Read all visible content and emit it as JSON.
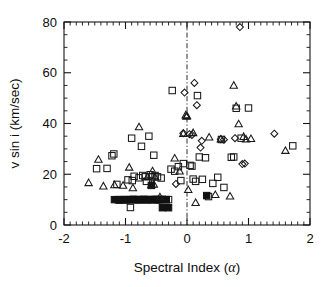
{
  "chart_data": {
    "type": "scatter",
    "title": "",
    "xlabel": "Spectral Index (α)",
    "ylabel": "v sin i (km/sec)",
    "xlim": [
      -2,
      2
    ],
    "ylim": [
      0,
      80
    ],
    "xticks": [
      -2,
      -1,
      0,
      1,
      2
    ],
    "xtick_labels": [
      "-2",
      "-1",
      "0",
      "1",
      "2"
    ],
    "yticks": [
      0,
      20,
      40,
      60,
      80
    ],
    "ytick_labels": [
      "0",
      "20",
      "40",
      "60",
      "80"
    ],
    "x_minor_tick_step": 0.1,
    "y_minor_tick_step": 5,
    "grid": false,
    "legend": null,
    "annotations": [
      {
        "type": "vline",
        "x": 0,
        "style": "dash-dot",
        "label": "alpha = 0 reference line"
      }
    ],
    "series": [
      {
        "name": "open-square",
        "marker": "square-open",
        "points": [
          [
            -1.47,
            22.2
          ],
          [
            -1.3,
            22.3
          ],
          [
            -1.22,
            27.3
          ],
          [
            -1.19,
            28.0
          ],
          [
            -1.14,
            16.0
          ],
          [
            -1.12,
            10.0
          ],
          [
            -1.07,
            10.0
          ],
          [
            -1.02,
            10.0
          ],
          [
            -0.98,
            9.9
          ],
          [
            -0.96,
            17.8
          ],
          [
            -0.95,
            10.0
          ],
          [
            -0.92,
            6.9
          ],
          [
            -0.9,
            34.2
          ],
          [
            -0.89,
            17.5
          ],
          [
            -0.88,
            10.1
          ],
          [
            -0.86,
            19.2
          ],
          [
            -0.84,
            10.0
          ],
          [
            -0.8,
            10.0
          ],
          [
            -0.78,
            18.6
          ],
          [
            -0.76,
            10.0
          ],
          [
            -0.74,
            31.0
          ],
          [
            -0.72,
            19.5
          ],
          [
            -0.7,
            10.1
          ],
          [
            -0.68,
            19.0
          ],
          [
            -0.66,
            17.2
          ],
          [
            -0.64,
            10.0
          ],
          [
            -0.62,
            35.0
          ],
          [
            -0.6,
            19.8
          ],
          [
            -0.58,
            10.0
          ],
          [
            -0.56,
            19.0
          ],
          [
            -0.54,
            27.5
          ],
          [
            -0.52,
            19.5
          ],
          [
            -0.5,
            10.0
          ],
          [
            -0.48,
            19.0
          ],
          [
            -0.46,
            10.0
          ],
          [
            -0.44,
            10.0
          ],
          [
            -0.42,
            18.5
          ],
          [
            -0.4,
            10.1
          ],
          [
            -0.34,
            10.0
          ],
          [
            -0.3,
            10.0
          ],
          [
            -0.26,
            22.0
          ],
          [
            -0.24,
            53.0
          ],
          [
            -0.2,
            21.2
          ],
          [
            -0.14,
            23.0
          ],
          [
            -0.1,
            17.5
          ],
          [
            -0.06,
            24.2
          ],
          [
            0.05,
            23.5
          ],
          [
            0.08,
            23.2
          ],
          [
            0.1,
            18.1
          ],
          [
            0.14,
            17.2
          ],
          [
            0.17,
            51.0
          ],
          [
            0.2,
            26.8
          ],
          [
            0.25,
            18.0
          ],
          [
            0.3,
            26.5
          ],
          [
            0.35,
            11.2
          ],
          [
            0.42,
            16.4
          ],
          [
            0.5,
            18.8
          ],
          [
            0.56,
            33.7
          ],
          [
            0.6,
            14.8
          ],
          [
            0.72,
            26.7
          ],
          [
            0.76,
            26.8
          ],
          [
            0.8,
            46.0
          ],
          [
            0.88,
            34.2
          ],
          [
            1.0,
            46.1
          ],
          [
            1.72,
            31.2
          ]
        ]
      },
      {
        "name": "filled-square",
        "marker": "square-filled",
        "points": [
          [
            -1.18,
            10.0
          ],
          [
            -1.1,
            9.8
          ],
          [
            -1.0,
            10.0
          ],
          [
            -0.92,
            10.0
          ],
          [
            -0.86,
            10.0
          ],
          [
            -0.8,
            10.0
          ],
          [
            -0.74,
            10.0
          ],
          [
            -0.7,
            10.0
          ],
          [
            -0.66,
            10.0
          ],
          [
            -0.62,
            10.0
          ],
          [
            -0.58,
            15.6
          ],
          [
            -0.56,
            10.0
          ],
          [
            -0.52,
            10.1
          ],
          [
            -0.48,
            10.0
          ],
          [
            -0.44,
            10.0
          ],
          [
            -0.4,
            6.8
          ],
          [
            -0.34,
            10.0
          ],
          [
            -0.3,
            6.8
          ],
          [
            0.32,
            11.6
          ]
        ]
      },
      {
        "name": "open-triangle",
        "marker": "triangle-open",
        "points": [
          [
            -1.6,
            16.8
          ],
          [
            -1.44,
            26.0
          ],
          [
            -1.36,
            15.5
          ],
          [
            -1.18,
            16.0
          ],
          [
            -1.04,
            15.8
          ],
          [
            -0.94,
            22.9
          ],
          [
            -0.88,
            14.8
          ],
          [
            -0.78,
            38.8
          ],
          [
            -0.64,
            19.2
          ],
          [
            -0.58,
            16.0
          ],
          [
            -0.56,
            21.5
          ],
          [
            -0.54,
            16.2
          ],
          [
            -0.52,
            19.0
          ],
          [
            -0.44,
            11.2
          ],
          [
            -0.2,
            26.5
          ],
          [
            -0.12,
            21.4
          ],
          [
            -0.06,
            36.2
          ],
          [
            -0.02,
            43.5
          ],
          [
            0.0,
            43.2
          ],
          [
            -0.01,
            43.0
          ],
          [
            0.02,
            14.1
          ],
          [
            0.1,
            36.5
          ],
          [
            0.14,
            9.0
          ],
          [
            0.36,
            34.8
          ],
          [
            0.46,
            12.1
          ],
          [
            0.55,
            34.0
          ],
          [
            0.7,
            11.5
          ],
          [
            0.76,
            55.2
          ],
          [
            0.8,
            47.0
          ],
          [
            0.84,
            40.0
          ],
          [
            0.92,
            35.0
          ],
          [
            0.96,
            34.0
          ],
          [
            1.04,
            34.2
          ],
          [
            1.6,
            29.5
          ]
        ]
      },
      {
        "name": "open-diamond",
        "marker": "diamond-open",
        "points": [
          [
            -0.18,
            16.2
          ],
          [
            -0.06,
            36.2
          ],
          [
            -0.04,
            52.2
          ],
          [
            0.04,
            35.8
          ],
          [
            0.08,
            35.5
          ],
          [
            0.12,
            56.0
          ],
          [
            0.16,
            47.2
          ],
          [
            0.22,
            30.5
          ],
          [
            0.24,
            33.2
          ],
          [
            0.55,
            33.8
          ],
          [
            0.6,
            33.6
          ],
          [
            0.78,
            34.2
          ],
          [
            0.86,
            78.0
          ],
          [
            0.9,
            24.0
          ],
          [
            0.94,
            24.2
          ],
          [
            1.42,
            36.0
          ]
        ]
      }
    ]
  },
  "axes": {
    "y_label": "v sin i (km/sec)",
    "x_label_main": "Spectral Index (",
    "x_label_symbol": "α",
    "x_label_close": ")"
  }
}
